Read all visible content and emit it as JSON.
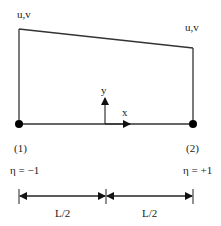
{
  "diagram": {
    "element": {
      "node_labels": {
        "left_dof": "u,v",
        "right_dof": "u,v"
      },
      "nodes": [
        {
          "id": "(1)",
          "eta": "η = −1"
        },
        {
          "id": "(2)",
          "eta": "η = +1"
        }
      ],
      "axes": {
        "y": "y",
        "x": "x"
      }
    },
    "dimensions": [
      {
        "label": "L/2"
      },
      {
        "label": "L/2"
      }
    ],
    "colors": {
      "line": "#333333",
      "node": "#000000"
    }
  }
}
